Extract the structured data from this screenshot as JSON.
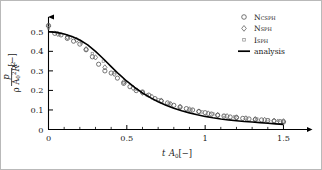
{
  "chart_data": {
    "type": "line",
    "title": "",
    "xlabel": "t A0[-]",
    "ylabel": "p/(rho A0^2 R^2)[-]",
    "xlim": [
      0,
      1.58
    ],
    "ylim": [
      0,
      0.545
    ],
    "grid": false,
    "legend_position": "top-right",
    "x_ticks": [
      0,
      0.5,
      1,
      1.5
    ],
    "x_tick_labels": [
      "0",
      "0.5",
      "1",
      "1.5"
    ],
    "x_minor_tick_step": 0.1,
    "y_ticks": [
      0,
      0.1,
      0.2,
      0.3,
      0.4,
      0.5
    ],
    "y_tick_labels": [
      "0",
      "0.1",
      "0.2",
      "0.3",
      "0.4",
      "0.5"
    ],
    "axis_style": "arrow-terminated",
    "series": [
      {
        "name": "analysis",
        "marker": "none",
        "style": "solid-line",
        "color": "#000000",
        "x": [
          0.0,
          0.05,
          0.1,
          0.15,
          0.2,
          0.25,
          0.3,
          0.35,
          0.4,
          0.45,
          0.5,
          0.55,
          0.6,
          0.65,
          0.7,
          0.75,
          0.8,
          0.85,
          0.9,
          0.95,
          1.0,
          1.05,
          1.1,
          1.15,
          1.2,
          1.25,
          1.3,
          1.35,
          1.4,
          1.45,
          1.5
        ],
        "values": [
          0.5,
          0.497,
          0.489,
          0.476,
          0.458,
          0.433,
          0.4,
          0.362,
          0.322,
          0.283,
          0.247,
          0.215,
          0.187,
          0.163,
          0.142,
          0.124,
          0.109,
          0.096,
          0.085,
          0.075,
          0.067,
          0.06,
          0.054,
          0.049,
          0.045,
          0.041,
          0.038,
          0.035,
          0.032,
          0.029,
          0.026
        ]
      },
      {
        "name": "NCSPH",
        "marker": "circle",
        "style": "open-marker",
        "color": "#4a4a4a",
        "x": [
          0.0,
          0.04,
          0.08,
          0.12,
          0.16,
          0.2,
          0.24,
          0.28,
          0.32,
          0.36,
          0.4,
          0.44,
          0.48,
          0.52,
          0.56,
          0.6,
          0.64,
          0.68,
          0.72,
          0.76,
          0.8,
          0.84,
          0.88,
          0.92,
          0.96,
          1.0,
          1.04,
          1.08,
          1.12,
          1.16,
          1.2,
          1.24,
          1.28,
          1.32,
          1.36,
          1.4,
          1.44,
          1.48,
          1.5
        ],
        "values": [
          0.532,
          0.492,
          0.484,
          0.466,
          0.452,
          0.437,
          0.408,
          0.372,
          0.334,
          0.3,
          0.289,
          0.263,
          0.236,
          0.219,
          0.199,
          0.192,
          0.176,
          0.158,
          0.145,
          0.136,
          0.124,
          0.115,
          0.107,
          0.1,
          0.092,
          0.086,
          0.079,
          0.073,
          0.069,
          0.064,
          0.061,
          0.057,
          0.054,
          0.051,
          0.049,
          0.046,
          0.043,
          0.04,
          0.038
        ]
      },
      {
        "name": "NSPH",
        "marker": "diamond",
        "style": "open-marker",
        "color": "#5a5a5a",
        "x": [
          0.0,
          0.06,
          0.12,
          0.18,
          0.24,
          0.3,
          0.36,
          0.42,
          0.48,
          0.54,
          0.6,
          0.66,
          0.72,
          0.78,
          0.84,
          0.9,
          0.96,
          1.02,
          1.08,
          1.14,
          1.2,
          1.26,
          1.32,
          1.38,
          1.44,
          1.5
        ],
        "values": [
          0.528,
          0.489,
          0.473,
          0.459,
          0.411,
          0.369,
          0.318,
          0.285,
          0.243,
          0.213,
          0.188,
          0.167,
          0.148,
          0.13,
          0.115,
          0.103,
          0.092,
          0.082,
          0.074,
          0.068,
          0.062,
          0.057,
          0.053,
          0.049,
          0.045,
          0.042
        ]
      },
      {
        "name": "ISPH",
        "marker": "square",
        "style": "open-marker",
        "color": "#8a8a8a",
        "x": [
          0.0,
          0.07,
          0.14,
          0.21,
          0.28,
          0.35,
          0.42,
          0.49,
          0.56,
          0.63,
          0.7,
          0.77,
          0.84,
          0.91,
          0.98,
          1.05,
          1.12,
          1.19,
          1.26,
          1.33,
          1.4,
          1.47,
          1.5
        ],
        "values": [
          0.52,
          0.487,
          0.47,
          0.443,
          0.389,
          0.35,
          0.291,
          0.241,
          0.205,
          0.176,
          0.152,
          0.132,
          0.116,
          0.102,
          0.09,
          0.08,
          0.072,
          0.065,
          0.059,
          0.054,
          0.05,
          0.046,
          0.044
        ]
      }
    ]
  },
  "legend": {
    "entries": [
      {
        "label": "NCSPH",
        "marker": "circle"
      },
      {
        "label": "NSPH",
        "marker": "diamond"
      },
      {
        "label": "ISPH",
        "marker": "square"
      },
      {
        "label": "analysis",
        "marker": "line"
      }
    ]
  },
  "axis_titles": {
    "x_main": "t A",
    "x_sub": "0",
    "x_unit": "[−]",
    "y_numer": "p",
    "y_denom_rho": "ρ A",
    "y_denom_sub": "0",
    "y_denom_sup": "2",
    "y_denom_r": "R",
    "y_denom_rsup": "2",
    "y_unit": "[−]"
  }
}
